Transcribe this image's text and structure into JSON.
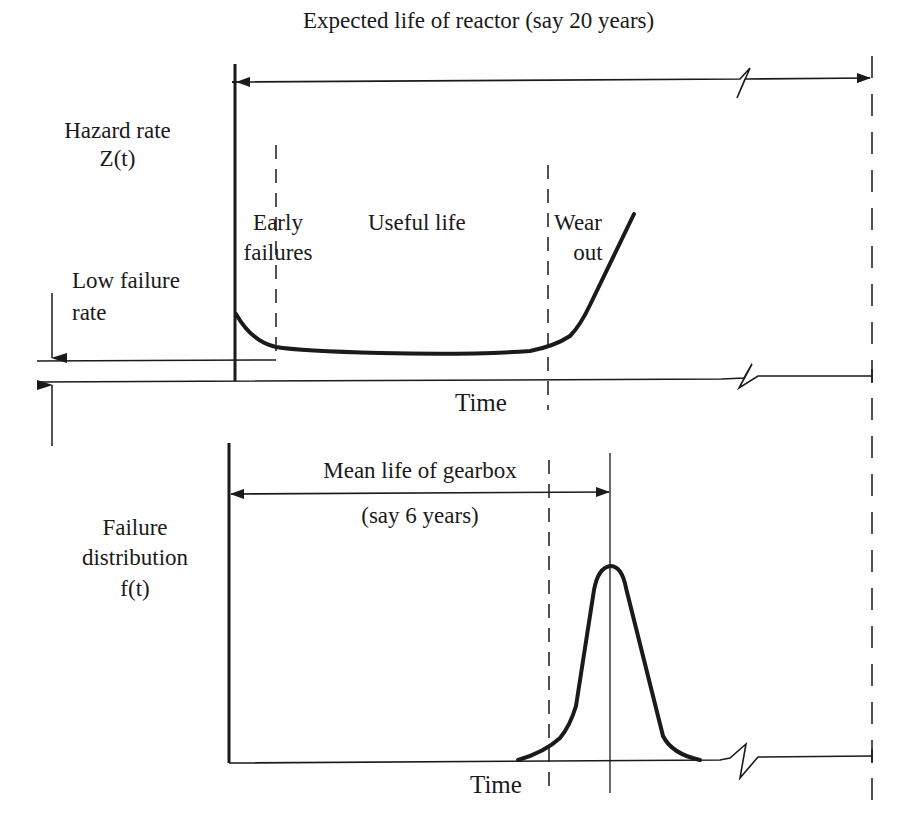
{
  "top_panel": {
    "span_label": "Expected life of reactor (say 20 years)",
    "y_axis_label_line1": "Hazard rate",
    "y_axis_label_line2": "Z(t)",
    "region_early_line1": "Early",
    "region_early_line2": "failures",
    "region_useful": "Useful life",
    "region_wear_line1": "Wear",
    "region_wear_line2": "out",
    "low_rate_line1": "Low failure",
    "low_rate_line2": "rate",
    "x_axis_label": "Time"
  },
  "bottom_panel": {
    "span_label_line1": "Mean life of gearbox",
    "span_label_line2": "(say 6 years)",
    "y_axis_label_line1": "Failure",
    "y_axis_label_line2": "distribution",
    "y_axis_label_line3": "f(t)",
    "x_axis_label": "Time"
  },
  "colors": {
    "ink": "#1a1a1a",
    "background": "#ffffff"
  }
}
